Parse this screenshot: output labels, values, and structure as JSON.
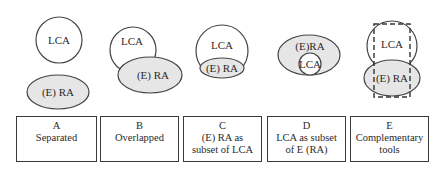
{
  "colors": {
    "stroke": "#444444",
    "fill_ra": "#e6e6e6",
    "fill_lca": "#ffffff"
  },
  "panels": [
    {
      "id": "A",
      "letter": "A",
      "caption_lines": [
        "Separated"
      ],
      "lca_label": "LCA",
      "ra_label": "(E) RA"
    },
    {
      "id": "B",
      "letter": "B",
      "caption_lines": [
        "Overlapped"
      ],
      "lca_label": "LCA",
      "ra_label": "(E) RA"
    },
    {
      "id": "C",
      "letter": "C",
      "caption_lines": [
        "(E) RA as",
        "subset of LCA"
      ],
      "lca_label": "LCA",
      "ra_label": "(E) RA"
    },
    {
      "id": "D",
      "letter": "D",
      "caption_lines": [
        "LCA as subset",
        "of E (RA)"
      ],
      "lca_label": "LCA",
      "ra_label": "(E)RA"
    },
    {
      "id": "E",
      "letter": "E",
      "caption_lines": [
        "Complementary",
        "tools"
      ],
      "lca_label": "LCA",
      "ra_label": "(E) RA"
    }
  ]
}
